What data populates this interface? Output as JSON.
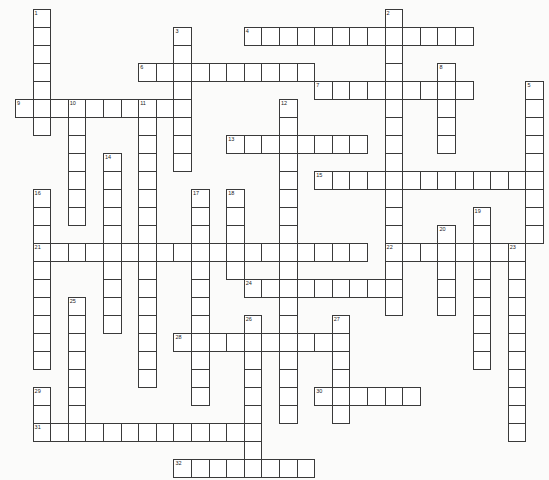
{
  "puzzle": {
    "type": "crossword",
    "cell_width": 17.6,
    "cell_height": 18,
    "origin_x": 15.5,
    "origin_y": 9,
    "colors": {
      "background": "#fbfbfa",
      "cell": "#ffffff",
      "border": "#3a3a3a"
    },
    "entries": [
      {
        "number": "1",
        "direction": "down",
        "row": 0,
        "col": 1,
        "length": 7
      },
      {
        "number": "2",
        "direction": "down",
        "row": 0,
        "col": 21,
        "length": 17
      },
      {
        "number": "3",
        "direction": "down",
        "row": 1,
        "col": 9,
        "length": 8
      },
      {
        "number": "4",
        "direction": "across",
        "row": 1,
        "col": 13,
        "length": 13
      },
      {
        "number": "5",
        "direction": "down",
        "row": 4,
        "col": 29,
        "length": 9
      },
      {
        "number": "6",
        "direction": "across",
        "row": 3,
        "col": 7,
        "length": 10
      },
      {
        "number": "7",
        "direction": "across",
        "row": 4,
        "col": 17,
        "length": 9
      },
      {
        "number": "8",
        "direction": "down",
        "row": 3,
        "col": 24,
        "length": 5
      },
      {
        "number": "9",
        "direction": "across",
        "row": 5,
        "col": 0,
        "length": 10
      },
      {
        "number": "10",
        "direction": "down",
        "row": 5,
        "col": 3,
        "length": 7
      },
      {
        "number": "11",
        "direction": "down",
        "row": 5,
        "col": 7,
        "length": 16
      },
      {
        "number": "12",
        "direction": "down",
        "row": 5,
        "col": 15,
        "length": 18
      },
      {
        "number": "13",
        "direction": "across",
        "row": 7,
        "col": 12,
        "length": 8
      },
      {
        "number": "14",
        "direction": "down",
        "row": 8,
        "col": 5,
        "length": 10
      },
      {
        "number": "15",
        "direction": "across",
        "row": 9,
        "col": 17,
        "length": 13
      },
      {
        "number": "16",
        "direction": "down",
        "row": 10,
        "col": 1,
        "length": 10
      },
      {
        "number": "17",
        "direction": "down",
        "row": 10,
        "col": 10,
        "length": 12
      },
      {
        "number": "18",
        "direction": "down",
        "row": 10,
        "col": 12,
        "length": 5
      },
      {
        "number": "19",
        "direction": "down",
        "row": 11,
        "col": 26,
        "length": 9
      },
      {
        "number": "20",
        "direction": "down",
        "row": 12,
        "col": 24,
        "length": 5
      },
      {
        "number": "21",
        "direction": "across",
        "row": 13,
        "col": 1,
        "length": 19
      },
      {
        "number": "22",
        "direction": "across",
        "row": 13,
        "col": 21,
        "length": 8
      },
      {
        "number": "23",
        "direction": "down",
        "row": 13,
        "col": 28,
        "length": 11
      },
      {
        "number": "24",
        "direction": "across",
        "row": 15,
        "col": 13,
        "length": 9
      },
      {
        "number": "25",
        "direction": "down",
        "row": 16,
        "col": 3,
        "length": 8
      },
      {
        "number": "26",
        "direction": "down",
        "row": 17,
        "col": 13,
        "length": 9
      },
      {
        "number": "27",
        "direction": "down",
        "row": 17,
        "col": 18,
        "length": 6
      },
      {
        "number": "28",
        "direction": "across",
        "row": 18,
        "col": 9,
        "length": 10
      },
      {
        "number": "29",
        "direction": "down",
        "row": 21,
        "col": 1,
        "length": 3
      },
      {
        "number": "30",
        "direction": "across",
        "row": 21,
        "col": 17,
        "length": 6
      },
      {
        "number": "31",
        "direction": "across",
        "row": 23,
        "col": 1,
        "length": 13
      },
      {
        "number": "32",
        "direction": "across",
        "row": 25,
        "col": 9,
        "length": 8
      }
    ]
  }
}
